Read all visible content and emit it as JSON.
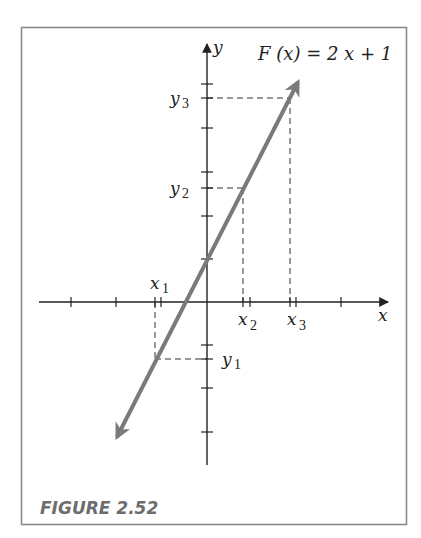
{
  "figure": {
    "caption": "FIGURE 2.52",
    "function_label": "F (x) = 2 x + 1",
    "axis_labels": {
      "x": "x",
      "y": "y"
    },
    "x_markers": [
      {
        "name": "x",
        "sub": "1"
      },
      {
        "name": "x",
        "sub": "2"
      },
      {
        "name": "x",
        "sub": "3"
      }
    ],
    "y_markers": [
      {
        "name": "y",
        "sub": "1"
      },
      {
        "name": "y",
        "sub": "2"
      },
      {
        "name": "y",
        "sub": "3"
      }
    ],
    "colors": {
      "frame": "#8a8a8a",
      "axes": "#222222",
      "line": "#7a7a7a",
      "caption": "#6d6d6d"
    }
  }
}
